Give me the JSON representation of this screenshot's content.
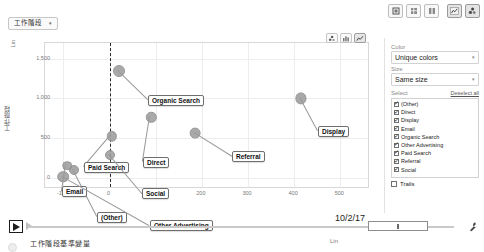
{
  "workspace": {
    "label": "工作階段",
    "caret": "▾"
  },
  "toolbar": {
    "buttons": [
      {
        "name": "export-icon",
        "glyph": "⌸",
        "label": "匯出",
        "active": false
      },
      {
        "name": "grid-icon",
        "glyph": "▦",
        "label": "表格",
        "active": false
      },
      {
        "name": "columns-icon",
        "glyph": "▥",
        "label": "欄",
        "active": false
      },
      {
        "name": "chart-edit-icon",
        "glyph": "◪",
        "label": "編輯圖表",
        "active": true
      },
      {
        "name": "bubble-chart-icon",
        "glyph": "⁜",
        "label": "泡泡圖",
        "active": true
      }
    ]
  },
  "chart_data": {
    "type": "scatter",
    "title": "",
    "xlabel": "工作階段基準變量",
    "ylabel": "工作階段",
    "xscale_label": "Lin",
    "yscale_label": "Lin",
    "xticks": [
      "-100",
      "0",
      "100",
      "200",
      "300",
      "400",
      "500"
    ],
    "xtick_values": [
      -100,
      0,
      100,
      200,
      300,
      400,
      500
    ],
    "yticks": [
      "0",
      "500",
      "1,000",
      "1,500"
    ],
    "ytick_values": [
      0,
      500,
      1000,
      1500
    ],
    "xlim": [
      -140,
      560
    ],
    "ylim": [
      -120,
      1700
    ],
    "grid": true,
    "zero_reference_x": 0,
    "points": [
      {
        "label": "Organic Search",
        "x": 20,
        "y": 1340,
        "r": 5.0,
        "lx": 148,
        "ly": 57
      },
      {
        "label": "Display",
        "x": 415,
        "y": 1000,
        "r": 4.6,
        "lx": 318,
        "ly": 88
      },
      {
        "label": "Referral",
        "x": 185,
        "y": 560,
        "r": 4.4,
        "lx": 232,
        "ly": 113
      },
      {
        "label": "Direct",
        "x": 90,
        "y": 760,
        "r": 4.2,
        "lx": 143,
        "ly": 119
      },
      {
        "label": "Paid Search",
        "x": 5,
        "y": 520,
        "r": 4.2,
        "lx": 84,
        "ly": 124
      },
      {
        "label": "Social",
        "x": 0,
        "y": 290,
        "r": 4.0,
        "lx": 142,
        "ly": 150
      },
      {
        "label": "(Other)",
        "x": -78,
        "y": 90,
        "r": 4.0,
        "lx": 97,
        "ly": 174
      },
      {
        "label": "Email",
        "x": -92,
        "y": 150,
        "r": 3.8,
        "lx": 62,
        "ly": 148
      },
      {
        "label": "Other Advertising",
        "x": -100,
        "y": 10,
        "r": 4.8,
        "lx": 150,
        "ly": 182
      }
    ]
  },
  "plot_tools": [
    {
      "name": "bubble-view-icon",
      "glyph": "⁘",
      "active": false
    },
    {
      "name": "bar-view-icon",
      "glyph": "▥",
      "active": false
    },
    {
      "name": "line-view-icon",
      "glyph": "∿",
      "active": true
    }
  ],
  "panel": {
    "color": {
      "label": "Color",
      "value": "Unique colors",
      "caret": "▾"
    },
    "size": {
      "label": "Size",
      "value": "Same size",
      "caret": "▾"
    },
    "select": {
      "label": "Select",
      "deselect_all": "Deselect all"
    },
    "items": [
      {
        "label": "(Other)",
        "checked": true
      },
      {
        "label": "Direct",
        "checked": true
      },
      {
        "label": "Display",
        "checked": true
      },
      {
        "label": "Email",
        "checked": true
      },
      {
        "label": "Organic Search",
        "checked": true
      },
      {
        "label": "Other Advertising",
        "checked": true
      },
      {
        "label": "Paid Search",
        "checked": true
      },
      {
        "label": "Referral",
        "checked": true
      },
      {
        "label": "Social",
        "checked": true
      }
    ],
    "trails": {
      "label": "Trails",
      "checked": false
    },
    "check_glyph": "✓"
  },
  "playback": {
    "play_glyph": "▶",
    "date": "10/2/17",
    "settings_glyph": "✎"
  }
}
